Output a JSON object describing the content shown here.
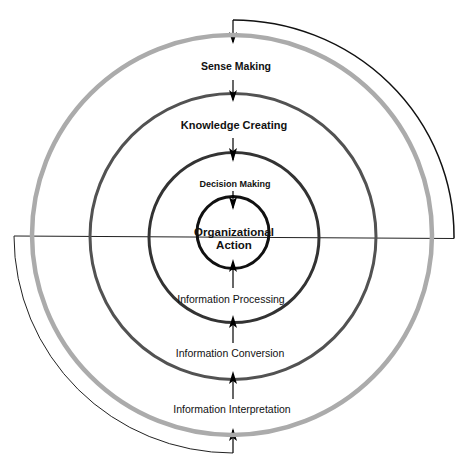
{
  "diagram": {
    "type": "concentric-circles",
    "center": {
      "x": 233,
      "y": 236
    },
    "rings": [
      {
        "id": "sense-making",
        "label": "Sense Making",
        "radius": 200,
        "stroke": "#ababab",
        "width": 4.5
      },
      {
        "id": "knowledge-creating",
        "label": "Knowledge Creating",
        "radius": 143,
        "stroke": "#525252",
        "width": 3
      },
      {
        "id": "decision-making",
        "label": "Decision Making",
        "radius": 85,
        "stroke": "#333333",
        "width": 3
      },
      {
        "id": "organizational-action",
        "label": "Organizational Action",
        "radius": 36,
        "stroke": "#111111",
        "width": 3
      }
    ],
    "labels": {
      "sense_making": "Sense Making",
      "knowledge_creating": "Knowledge Creating",
      "decision_making": "Decision Making",
      "organizational_action_line1": "Organizational",
      "organizational_action_line2": "Action",
      "information_processing": "Information Processing",
      "information_conversion": "Information Conversion",
      "information_interpretation": "Information Interpretation"
    },
    "flows": {
      "inward": [
        "Sense Making",
        "Knowledge Creating",
        "Decision Making",
        "Organizational Action"
      ],
      "outward": [
        "Information Interpretation",
        "Information Conversion",
        "Information Processing",
        "Organizational Action"
      ]
    },
    "colors": {
      "outer_ring": "#ababab",
      "middle_ring": "#525252",
      "decision_ring": "#333333",
      "core_ring": "#111111",
      "arrows": "#000000"
    }
  }
}
